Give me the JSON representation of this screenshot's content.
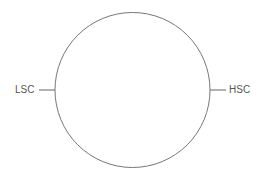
{
  "diagram": {
    "shape": "circle",
    "stroke_color": "#777777",
    "labels": {
      "left": "LSC",
      "right": "HSC"
    }
  }
}
